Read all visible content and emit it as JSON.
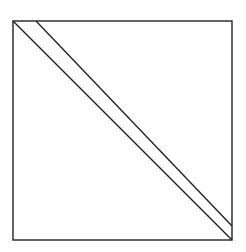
{
  "diagram": {
    "type": "geometric-figure",
    "stroke_color": "#222222",
    "background": "#ffffff",
    "square": {
      "x": 13,
      "y": 21,
      "width": 219,
      "height": 219
    },
    "lines": [
      {
        "name": "main-diagonal",
        "x1": 13,
        "y1": 21,
        "x2": 232,
        "y2": 240
      },
      {
        "name": "parallel-line",
        "x1": 36,
        "y1": 21,
        "x2": 232,
        "y2": 226
      }
    ]
  }
}
